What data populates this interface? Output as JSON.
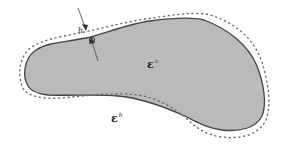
{
  "figure": {
    "type": "interface-region-diagram",
    "colors": {
      "region_fill": "#b9b9b9",
      "solid_outline": "#444444",
      "dashed_outline": "#666666",
      "arrow": "#555555",
      "background": "#ffffff"
    },
    "labels": {
      "inner": {
        "symbol": "ε",
        "superscript": "a"
      },
      "outer": {
        "symbol": "ε",
        "superscript": "b"
      },
      "thickness": "h"
    }
  }
}
